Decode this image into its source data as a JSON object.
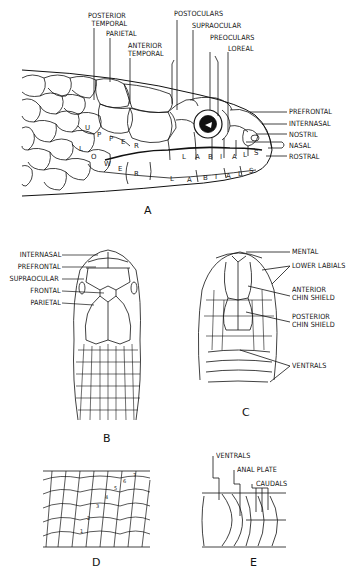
{
  "figure": {
    "panels": {
      "A": {
        "letter": "A",
        "view": "lateral head",
        "labels_top": [
          {
            "id": "posterior-temporal",
            "text": "POSTERIOR",
            "text2": "TEMPORAL"
          },
          {
            "id": "parietal",
            "text": "PARIETAL"
          },
          {
            "id": "anterior-temporal",
            "text": "ANTERIOR",
            "text2": "TEMPORAL"
          },
          {
            "id": "postoculars",
            "text": "POSTOCULARS"
          },
          {
            "id": "supraocular",
            "text": "SUPRAOCULAR"
          },
          {
            "id": "preoculars",
            "text": "PREOCULARS"
          },
          {
            "id": "loreal",
            "text": "LOREAL"
          }
        ],
        "labels_right": [
          {
            "id": "prefrontal",
            "text": "PREFRONTAL"
          },
          {
            "id": "internasal",
            "text": "INTERNASAL"
          },
          {
            "id": "nostril",
            "text": "NOSTRIL"
          },
          {
            "id": "nasal",
            "text": "NASAL"
          },
          {
            "id": "rostral",
            "text": "ROSTRAL"
          }
        ],
        "in_scale_text": {
          "upper": [
            "U",
            "P",
            "P",
            "E",
            "R"
          ],
          "lower": [
            "L",
            "O",
            "W",
            "E",
            "R"
          ],
          "upper_labials": [
            "L",
            "A",
            "B",
            "I",
            "A",
            "L",
            "S"
          ],
          "lower_labials": [
            "L",
            "A",
            "B",
            "I",
            "A",
            "L",
            "S"
          ]
        }
      },
      "B": {
        "letter": "B",
        "view": "dorsal head",
        "labels_left": [
          {
            "id": "internasal",
            "text": "INTERNASAL"
          },
          {
            "id": "prefrontal",
            "text": "PREFRONTAL"
          },
          {
            "id": "supraocular",
            "text": "SUPRAOCULAR"
          },
          {
            "id": "frontal",
            "text": "FRONTAL"
          },
          {
            "id": "parietal",
            "text": "PARIETAL"
          }
        ]
      },
      "C": {
        "letter": "C",
        "view": "ventral head",
        "labels_right": [
          {
            "id": "mental",
            "text": "MENTAL"
          },
          {
            "id": "lower-labials",
            "text": "LOWER LABIALS"
          },
          {
            "id": "anterior-chin-shield",
            "text": "ANTERIOR",
            "text2": "CHIN SHIELD"
          },
          {
            "id": "posterior-chin-shield",
            "text": "POSTERIOR",
            "text2": "CHIN SHIELD"
          },
          {
            "id": "ventrals",
            "text": "VENTRALS"
          }
        ]
      },
      "D": {
        "letter": "D",
        "view": "dorsal scale rows counting",
        "row_numbers": [
          "1",
          "2",
          "3",
          "4",
          "5",
          "6",
          "7"
        ]
      },
      "E": {
        "letter": "E",
        "view": "ventral body at vent",
        "labels_top": [
          {
            "id": "ventrals",
            "text": "VENTRALS"
          },
          {
            "id": "anal-plate",
            "text": "ANAL PLATE"
          },
          {
            "id": "caudals",
            "text": "CAUDALS"
          }
        ]
      }
    }
  }
}
